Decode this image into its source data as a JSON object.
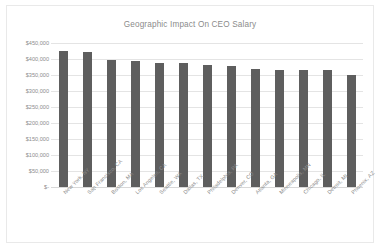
{
  "chart": {
    "title": "Geographic Impact On CEO Salary",
    "bar_color": "#5e5e5e",
    "grid_color": "#e4e4e4",
    "text_color": "#8d8d8d",
    "background": "#ffffff",
    "border_color": "#e9e9e9"
  },
  "chart_data": {
    "type": "bar",
    "title": "Geographic Impact On CEO Salary",
    "xlabel": "",
    "ylabel": "",
    "ylim": [
      0,
      450000
    ],
    "grid": true,
    "legend": "none",
    "categories": [
      "New York, NY",
      "San Francisco, CA",
      "Boston, MA",
      "Los Angeles, CA",
      "Seattle, WA",
      "Dallas, TX",
      "Philadelphia, PA",
      "Denver, CO",
      "Atlanta, GA",
      "Minneapolis, MN",
      "Chicago, IL",
      "Detroit, MI",
      "Phoenix, AZ"
    ],
    "values": [
      425000,
      422000,
      397000,
      393000,
      389000,
      386000,
      380000,
      377000,
      369000,
      367000,
      367000,
      365000,
      351000
    ],
    "ytick_labels": [
      "$450,000",
      "$400,000",
      "$350,000",
      "$300,000",
      "$250,000",
      "$200,000",
      "$150,000",
      "$100,000",
      "$50,000",
      "$-"
    ],
    "ytick_values": [
      450000,
      400000,
      350000,
      300000,
      250000,
      200000,
      150000,
      100000,
      50000,
      0
    ]
  }
}
